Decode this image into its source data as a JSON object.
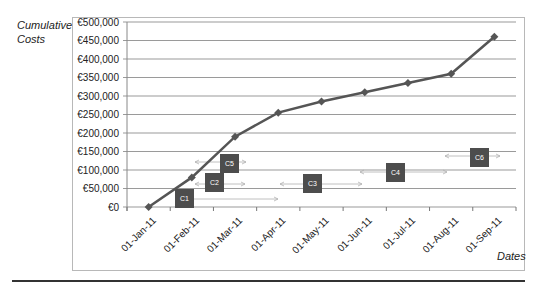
{
  "chart_data": {
    "type": "line",
    "title": "",
    "ylabel": "Cumulative Costs",
    "xlabel": "Dates",
    "ylim": [
      0,
      500000
    ],
    "y_ticks": [
      "€0",
      "€50,000",
      "€100,000",
      "€150,000",
      "€200,000",
      "€250,000",
      "€300,000",
      "€350,000",
      "€400,000",
      "€450,000",
      "€500,000"
    ],
    "categories": [
      "01-Jan-11",
      "01-Feb-11",
      "01-Mar-11",
      "01-Apr-11",
      "01-May-11",
      "01-Jun-11",
      "01-Jul-11",
      "01-Aug-11",
      "01-Sep-11"
    ],
    "series": [
      {
        "name": "Cumulative Costs",
        "values": [
          0,
          80000,
          190000,
          255000,
          285000,
          310000,
          335000,
          360000,
          460000
        ],
        "color": "#555555",
        "marker": "diamond"
      }
    ],
    "grid": true,
    "legend": "none",
    "annotations": [
      {
        "label": "C1",
        "box_x": 175,
        "box_y": 189,
        "arrow_from": 175,
        "arrow_to": 278,
        "arrow_y": 199
      },
      {
        "label": "C2",
        "box_x": 205,
        "box_y": 173,
        "arrow_from": 195,
        "arrow_to": 245,
        "arrow_y": 184
      },
      {
        "label": "C5",
        "box_x": 220,
        "box_y": 154,
        "arrow_from": 195,
        "arrow_to": 246,
        "arrow_y": 162
      },
      {
        "label": "C3",
        "box_x": 303,
        "box_y": 174,
        "arrow_from": 280,
        "arrow_to": 362,
        "arrow_y": 184
      },
      {
        "label": "C4",
        "box_x": 386,
        "box_y": 163,
        "arrow_from": 360,
        "arrow_to": 447,
        "arrow_y": 172
      },
      {
        "label": "C6",
        "box_x": 470,
        "box_y": 148,
        "arrow_from": 445,
        "arrow_to": 500,
        "arrow_y": 156
      }
    ]
  },
  "labels": {
    "ylabel_line1": "Cumulative",
    "ylabel_line2": "Costs",
    "xlabel": "Dates"
  },
  "colors": {
    "line": "#555555",
    "box": "#4d4d4d",
    "grid": "#9a9a9a",
    "arrow": "#b0b0b0"
  }
}
